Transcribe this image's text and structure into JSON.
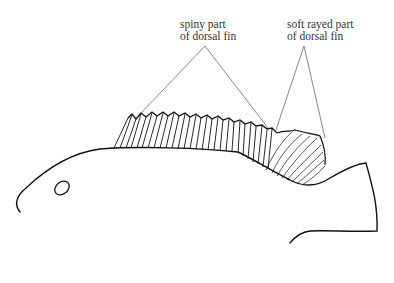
{
  "diagram": {
    "labels": [
      {
        "id": "spiny",
        "line1": "spiny part",
        "line2": "of dorsal fin"
      },
      {
        "id": "soft",
        "line1": "soft rayed part",
        "line2": "of dorsal fin"
      }
    ],
    "colors": {
      "stroke": "#111111",
      "text": "#333333",
      "leader": "#555555",
      "background": "#ffffff"
    }
  }
}
